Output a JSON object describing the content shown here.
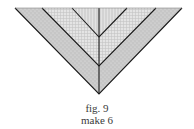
{
  "figure": {
    "type": "quilt-triangle-diagram",
    "strips": [
      {
        "name": "outer-strip",
        "pattern": "dotted-gray",
        "color": "#c8c8c8"
      },
      {
        "name": "middle-strip",
        "pattern": "fine-grid",
        "color": "#dedede"
      },
      {
        "name": "inner-strip",
        "pattern": "vertical-lines",
        "color": "#d6d6d6"
      }
    ],
    "line_color": "#1a1a1a"
  },
  "caption": {
    "label": "fig. 9",
    "instruction": "make 6"
  }
}
